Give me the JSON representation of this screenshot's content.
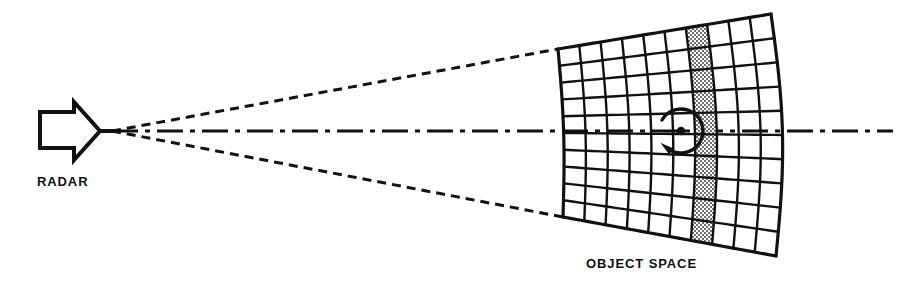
{
  "figure": {
    "background_color": "#ffffff",
    "ink_color": "#111111",
    "width": 900,
    "height": 301
  },
  "labels": {
    "radar": "RADAR",
    "object_space": "OBJECT SPACE"
  },
  "radar": {
    "name": "horn-antenna",
    "aperture_x": 40,
    "aperture_top_y": 112,
    "aperture_bottom_y": 148,
    "throat_x": 100,
    "apex_x": 112,
    "axis_y": 131,
    "line_width": 4
  },
  "beam": {
    "style": "dashed",
    "dash_pattern": "9,6",
    "line_width": 3,
    "apex": {
      "x": 112,
      "y": 131
    },
    "upper_end": {
      "x": 558,
      "y": 49
    },
    "lower_end": {
      "x": 563,
      "y": 217
    }
  },
  "axis": {
    "name": "boresight-centerline",
    "style": "dash-dot",
    "dash_pattern": "26,7,5,7",
    "line_width": 3,
    "start_x": 112,
    "end_x": 893,
    "y": 131
  },
  "object_space_grid": {
    "columns": 10,
    "rows": 10,
    "shaded_column_index": 7,
    "shaded_fill": "checkerboard-halftone",
    "shaded_color": "#7c7c7c",
    "line_width": 2.4,
    "border_width": 3.2,
    "corners": {
      "top_left": {
        "x": 558,
        "y": 49
      },
      "top_right": {
        "x": 771,
        "y": 14
      },
      "bottom_right": {
        "x": 776,
        "y": 256
      },
      "bottom_left": {
        "x": 563,
        "y": 217
      }
    },
    "curvature_bulge": 9
  },
  "rotation_marker": {
    "name": "rotation-arrow",
    "direction": "counterclockwise",
    "center": {
      "x": 681,
      "y": 131
    },
    "radius": 22,
    "center_dot_radius": 4.2,
    "arrowhead_at": "lower-left"
  },
  "label_positions": {
    "radar": {
      "x": 37,
      "y": 186
    },
    "object_space": {
      "x": 586,
      "y": 268
    }
  }
}
